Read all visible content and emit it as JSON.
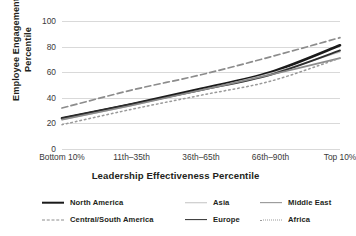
{
  "chart_data": {
    "type": "line",
    "title": "",
    "xlabel": "Leadership Effectiveness Percentile",
    "ylabel": "Employee Engagement Percentile",
    "ylabel_line1": "Employee Engagement",
    "ylabel_line2": "Percentile",
    "categories": [
      "Bottom 10%",
      "11th–35th",
      "36th–65th",
      "66th–90th",
      "Top 10%"
    ],
    "ylim": [
      0,
      100
    ],
    "yticks": [
      0,
      20,
      40,
      60,
      80,
      100
    ],
    "grid": true,
    "legend_position": "bottom",
    "series": [
      {
        "name": "North America",
        "values": [
          24,
          35,
          47,
          60,
          81
        ],
        "color": "#1a1a1a",
        "width": 2.6,
        "dash": "none"
      },
      {
        "name": "Central/South America",
        "values": [
          32,
          46,
          58,
          72,
          87
        ],
        "color": "#8c8c8c",
        "width": 1.7,
        "dash": "dashed"
      },
      {
        "name": "Asia",
        "values": [
          23,
          34,
          46,
          59,
          76
        ],
        "color": "#c2c2c2",
        "width": 1.5,
        "dash": "none"
      },
      {
        "name": "Europe",
        "values": [
          24,
          35,
          46,
          58,
          77
        ],
        "color": "#2e2e2e",
        "width": 1.8,
        "dash": "none"
      },
      {
        "name": "Middle East",
        "values": [
          23,
          34,
          46,
          58,
          71
        ],
        "color": "#8c8c8c",
        "width": 1.7,
        "dash": "none"
      },
      {
        "name": "Africa",
        "values": [
          19,
          31,
          42,
          53,
          71
        ],
        "color": "#9a9a9a",
        "width": 1.5,
        "dash": "dotted"
      }
    ]
  },
  "legend": {
    "items": [
      {
        "label": "North America"
      },
      {
        "label": "Asia"
      },
      {
        "label": "Middle East"
      },
      {
        "label": "Central/South America"
      },
      {
        "label": "Europe"
      },
      {
        "label": "Africa"
      }
    ]
  }
}
